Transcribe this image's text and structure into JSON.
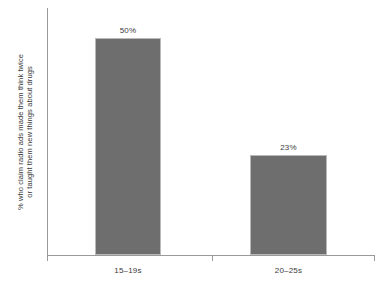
{
  "chart_data": {
    "type": "bar",
    "title": "",
    "subtitle": "",
    "categories": [
      "15–19s",
      "20–25s"
    ],
    "values": [
      50,
      23
    ],
    "value_labels": [
      "50%",
      "23%"
    ],
    "series": [
      {
        "name": "",
        "values": [
          50,
          23
        ]
      }
    ],
    "xlabel": "",
    "ylabel_lines": [
      "% who claim radio ads made them think twice",
      "or taught them new things about drugs"
    ],
    "ylabel": "% who claim radio ads made them think twice or taught them new things about drugs",
    "ylim": [
      0,
      57
    ],
    "grid": false,
    "legend": false,
    "legend_position": "none",
    "y_tick_labels": [],
    "annotations": [],
    "colors": {
      "bar_fill": "#6e6e6e",
      "bar_border": "#b9b9b9",
      "axis": "#9a9a9a",
      "text": "#3a3a3a",
      "background": "#ffffff"
    }
  },
  "axis": {
    "tick_count": 3
  }
}
